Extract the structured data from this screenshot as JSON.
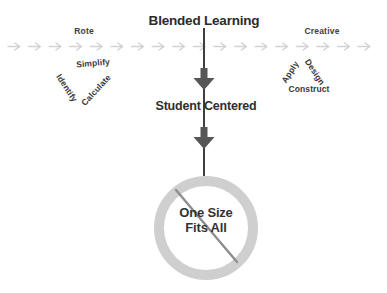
{
  "diagram": {
    "title": "Blended Learning",
    "center_label": "Student Centered",
    "prohibited": {
      "line1": "One Size",
      "line2": "Fits All"
    },
    "spectrum": {
      "left_end": "Rote",
      "right_end": "Creative",
      "arrow_count": 18,
      "arrow_icon": "dashed-right-arrow"
    },
    "left_skills": {
      "top": "Simplify",
      "down_slope": "Identify",
      "up_slope": "Calculate"
    },
    "right_skills": {
      "up_slope": "Apply",
      "down_slope": "Design",
      "bottom": "Construct"
    },
    "colors": {
      "ink": "#2e2e2e",
      "flow_arrow": "#d2d2d2",
      "flow_line": "#3f3f3f",
      "block_arrow": "#565656",
      "ring": "#cfcfcf",
      "slash": "#8e8e8e"
    }
  }
}
